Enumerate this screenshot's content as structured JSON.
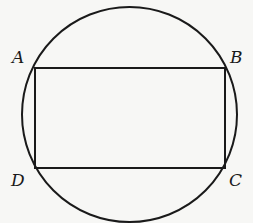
{
  "diagram": {
    "title": "",
    "circle": {
      "cx": 129.5,
      "cy": 114.5,
      "r": 107.5
    },
    "rectangle": {
      "x": 35,
      "y": 68,
      "width": 190,
      "height": 100
    },
    "colors": {
      "stroke": "#1a1a1a",
      "background": "#f7f7f5"
    },
    "vertices": [
      {
        "label": "A",
        "x": 35,
        "y": 68,
        "label_x": 12,
        "label_y": 63
      },
      {
        "label": "B",
        "x": 225,
        "y": 68,
        "label_x": 230,
        "label_y": 63
      },
      {
        "label": "C",
        "x": 225,
        "y": 168,
        "label_x": 229,
        "label_y": 186
      },
      {
        "label": "D",
        "x": 35,
        "y": 168,
        "label_x": 11,
        "label_y": 186
      }
    ]
  }
}
